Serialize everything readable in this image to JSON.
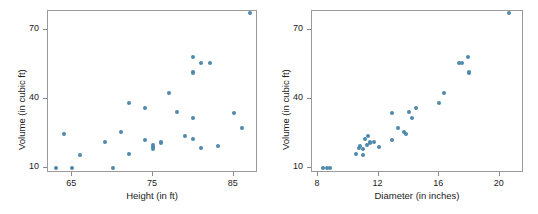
{
  "figure": {
    "background_color": "#ffffff",
    "point_color": "#4f89ad",
    "axis_color": "#9a9a9a",
    "text_color": "#1b1b1b"
  },
  "chart_data": [
    {
      "type": "scatter",
      "title": "",
      "xlabel": "Height (in ft)",
      "ylabel": "Volume (in cubic ft)",
      "xlim": [
        62,
        88
      ],
      "ylim": [
        8,
        78
      ],
      "xticks": [
        65,
        75,
        85
      ],
      "xtick_labels": [
        "65",
        "75",
        "85"
      ],
      "yticks": [
        10,
        40,
        70
      ],
      "ytick_labels": [
        "10",
        "40",
        "70"
      ],
      "grid": false,
      "legend": "none",
      "x": [
        70,
        65,
        63,
        72,
        81,
        83,
        66,
        75,
        80,
        75,
        79,
        76,
        76,
        69,
        75,
        74,
        85,
        86,
        71,
        64,
        78,
        80,
        74,
        72,
        77,
        81,
        82,
        80,
        80,
        80,
        87
      ],
      "y": [
        10.3,
        10.3,
        10.2,
        16.4,
        18.8,
        19.7,
        15.6,
        18.2,
        22.6,
        19.9,
        24.2,
        21.0,
        21.4,
        21.3,
        19.1,
        22.2,
        33.8,
        27.4,
        25.7,
        24.9,
        34.5,
        31.7,
        36.3,
        38.3,
        42.6,
        55.4,
        55.7,
        58.3,
        51.5,
        51.0,
        77.0
      ]
    },
    {
      "type": "scatter",
      "title": "",
      "xlabel": "Diameter (in inches)",
      "ylabel": "Volume (in cubic ft)",
      "xlim": [
        7.6,
        21.6
      ],
      "ylim": [
        8,
        78
      ],
      "xticks": [
        8,
        12,
        16,
        20
      ],
      "xtick_labels": [
        "8",
        "12",
        "16",
        "20"
      ],
      "yticks": [
        10,
        40,
        70
      ],
      "ytick_labels": [
        "10",
        "40",
        "70"
      ],
      "grid": false,
      "legend": "none",
      "x": [
        8.3,
        8.6,
        8.8,
        10.5,
        10.7,
        10.8,
        11.0,
        11.0,
        11.1,
        11.2,
        11.3,
        11.4,
        11.4,
        11.7,
        12.0,
        12.9,
        12.9,
        13.3,
        13.7,
        13.8,
        14.0,
        14.2,
        14.5,
        16.0,
        16.3,
        17.3,
        17.5,
        17.9,
        18.0,
        18.0,
        20.6
      ],
      "y": [
        10.3,
        10.3,
        10.2,
        16.4,
        18.8,
        19.7,
        15.6,
        18.2,
        22.6,
        19.9,
        24.2,
        21.0,
        21.4,
        21.3,
        19.1,
        22.2,
        33.8,
        27.4,
        25.7,
        24.9,
        34.5,
        31.7,
        36.3,
        38.3,
        42.6,
        55.4,
        55.7,
        58.3,
        51.5,
        51.0,
        77.0
      ]
    }
  ],
  "panels": {
    "left": {
      "y_axis_title": "Volume (in cubic ft)",
      "x_axis_title": "Height (in ft)"
    },
    "right": {
      "y_axis_title": "Volume (in cubic ft)",
      "x_axis_title": "Diameter (in inches)"
    }
  }
}
